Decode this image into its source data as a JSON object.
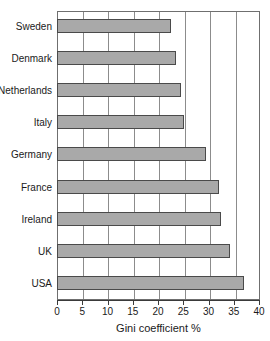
{
  "chart_data": {
    "type": "bar",
    "orientation": "horizontal",
    "title": "",
    "xlabel": "Gini coefficient %",
    "ylabel": "",
    "categories": [
      "Sweden",
      "Denmark",
      "Netherlands",
      "Italy",
      "Germany",
      "France",
      "Ireland",
      "UK",
      "USA"
    ],
    "values": [
      22.5,
      23.5,
      24.5,
      25.2,
      29.5,
      32.0,
      32.5,
      34.3,
      37.0
    ],
    "xlim": [
      0,
      40
    ],
    "xticks": [
      0,
      5,
      10,
      15,
      20,
      25,
      30,
      35,
      40
    ],
    "xtick_labels": [
      "0",
      "5",
      "10",
      "15",
      "20",
      "25",
      "30",
      "35",
      "40"
    ],
    "grid": "vertical",
    "legend": "none",
    "bar_color": "#a9a9a9",
    "bar_border_color": "#4a4a4a",
    "gridline_color": "#8c8c8c",
    "axis_color": "#3a3a3a"
  },
  "clipped_title_glyph": ""
}
